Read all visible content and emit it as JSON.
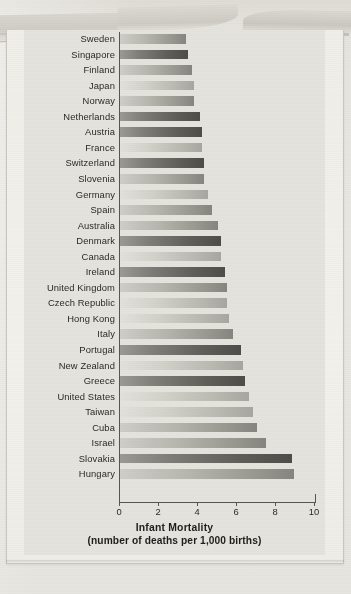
{
  "figure": {
    "kind": "scanned-book-figure",
    "background_color": "#e4e3dd",
    "page_color": "#efeee9"
  },
  "chart_data": {
    "type": "bar",
    "orientation": "horizontal",
    "title": "",
    "xlabel": "Infant Mortality",
    "xlabel_sub": "(number of deaths per 1,000 births)",
    "ylabel": "",
    "xlim": [
      0,
      10
    ],
    "xticks": [
      0,
      2,
      4,
      6,
      8,
      10
    ],
    "xtick_labels": [
      "0",
      "2",
      "4",
      "6",
      "8",
      "10"
    ],
    "grid": false,
    "legend": "none",
    "sort": "ascending",
    "categories": [
      "Sweden",
      "Singapore",
      "Finland",
      "Japan",
      "Norway",
      "Netherlands",
      "Austria",
      "France",
      "Switzerland",
      "Slovenia",
      "Germany",
      "Spain",
      "Australia",
      "Denmark",
      "Canada",
      "Ireland",
      "United Kingdom",
      "Czech Republic",
      "Hong Kong",
      "Italy",
      "Portugal",
      "New Zealand",
      "Greece",
      "United States",
      "Taiwan",
      "Cuba",
      "Israel",
      "Slovakia",
      "Hungary"
    ],
    "values": [
      3.4,
      3.5,
      3.7,
      3.8,
      3.8,
      4.1,
      4.2,
      4.2,
      4.3,
      4.3,
      4.5,
      4.7,
      5.0,
      5.2,
      5.2,
      5.4,
      5.5,
      5.5,
      5.6,
      5.8,
      6.2,
      6.3,
      6.4,
      6.6,
      6.8,
      7.0,
      7.5,
      8.8,
      8.9
    ],
    "bar_shades": [
      "mid",
      "dark",
      "mid",
      "light",
      "mid",
      "dark",
      "dark",
      "light",
      "dark",
      "mid",
      "light",
      "mid",
      "mid",
      "dark",
      "light",
      "dark",
      "mid",
      "light",
      "light",
      "mid",
      "dark",
      "light",
      "dark",
      "light",
      "light",
      "mid",
      "mid",
      "dark",
      "mid"
    ]
  }
}
